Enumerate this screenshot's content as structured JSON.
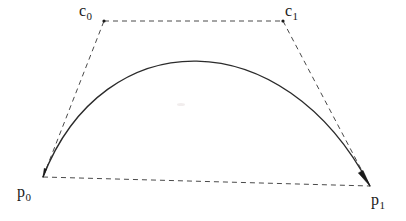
{
  "figure": {
    "width": 406,
    "height": 221,
    "background_color": "#ffffff",
    "stroke_color": "#2b2b2b",
    "dash_color": "#4a4a4a"
  },
  "labels": {
    "c0": {
      "base": "c",
      "sub": "0"
    },
    "c1": {
      "base": "c",
      "sub": "1"
    },
    "p0": {
      "base": "p",
      "sub": "0"
    },
    "p1": {
      "base": "p",
      "sub": "1"
    }
  },
  "chart_data": {
    "type": "line",
    "title": "",
    "xlabel": "",
    "ylabel": "",
    "grid": false,
    "legend": "none",
    "xlim": [
      0,
      406
    ],
    "ylim": [
      221,
      0
    ],
    "points": [
      {
        "name": "p0",
        "label": "p0",
        "x": 43,
        "y": 177,
        "role": "endpoint"
      },
      {
        "name": "c0",
        "label": "c0",
        "x": 104,
        "y": 21,
        "role": "control"
      },
      {
        "name": "c1",
        "label": "c1",
        "x": 283,
        "y": 21,
        "role": "control"
      },
      {
        "name": "p1",
        "label": "p1",
        "x": 370,
        "y": 186,
        "role": "endpoint"
      }
    ],
    "curve": {
      "kind": "cubic-bezier",
      "start": [
        43,
        177
      ],
      "control1": [
        104,
        21
      ],
      "control2": [
        283,
        21
      ],
      "end": [
        370,
        186
      ],
      "apex": [
        193,
        31
      ],
      "style": "solid",
      "width": 1.4
    },
    "control_polygon": {
      "style": "dashed",
      "segments": [
        {
          "name": "p0-c0",
          "from": [
            43,
            177
          ],
          "to": [
            104,
            21
          ]
        },
        {
          "name": "c0-c1",
          "from": [
            104,
            21
          ],
          "to": [
            283,
            21
          ]
        },
        {
          "name": "c1-p1",
          "from": [
            283,
            21
          ],
          "to": [
            370,
            186
          ]
        },
        {
          "name": "p0-p1",
          "from": [
            43,
            177
          ],
          "to": [
            370,
            186
          ]
        }
      ]
    },
    "arrowheads": [
      {
        "name": "arrow-at-p0",
        "at": [
          43,
          177
        ],
        "direction": "down-left"
      },
      {
        "name": "arrow-at-p1",
        "at": [
          370,
          186
        ],
        "direction": "down-right"
      }
    ]
  }
}
